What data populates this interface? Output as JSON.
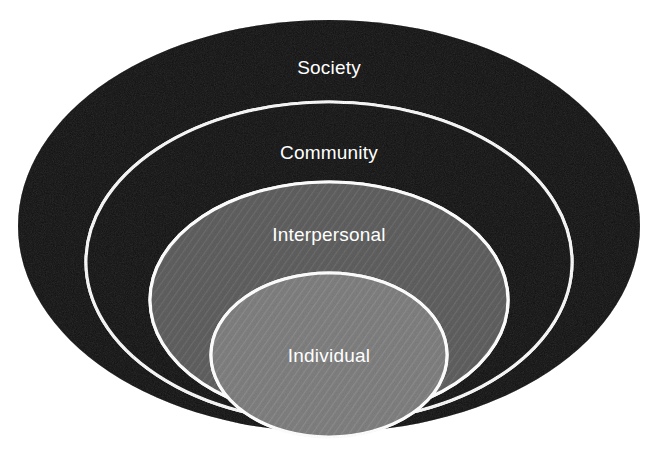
{
  "diagram": {
    "type": "nested-ellipse-diagram",
    "background_color": "#ffffff",
    "stroke_color": "#ffffff",
    "label_color": "#ffffff",
    "layers": [
      {
        "label": "Society",
        "level": 1,
        "position": "outermost",
        "fill_color": "#4e4e4e",
        "texture": "noise-grain",
        "cx": 329,
        "cy": 226,
        "rx": 311,
        "ry": 206,
        "label_x": 329,
        "label_y": 69
      },
      {
        "label": "Community",
        "level": 2,
        "position": "second",
        "fill_color": "#4e4e4e",
        "texture": "noise-grain",
        "cx": 329,
        "cy": 262,
        "rx": 243,
        "ry": 160,
        "label_x": 329,
        "label_y": 154
      },
      {
        "label": "Interpersonal",
        "level": 3,
        "position": "third",
        "fill_color": "#919191",
        "texture": "diagonal-hatch",
        "cx": 329,
        "cy": 300,
        "rx": 179,
        "ry": 118,
        "label_x": 329,
        "label_y": 236
      },
      {
        "label": "Individual",
        "level": 4,
        "position": "innermost",
        "fill_color": "#adadad",
        "texture": "diagonal-hatch",
        "cx": 329,
        "cy": 355,
        "rx": 118,
        "ry": 82,
        "label_x": 329,
        "label_y": 357
      }
    ]
  }
}
